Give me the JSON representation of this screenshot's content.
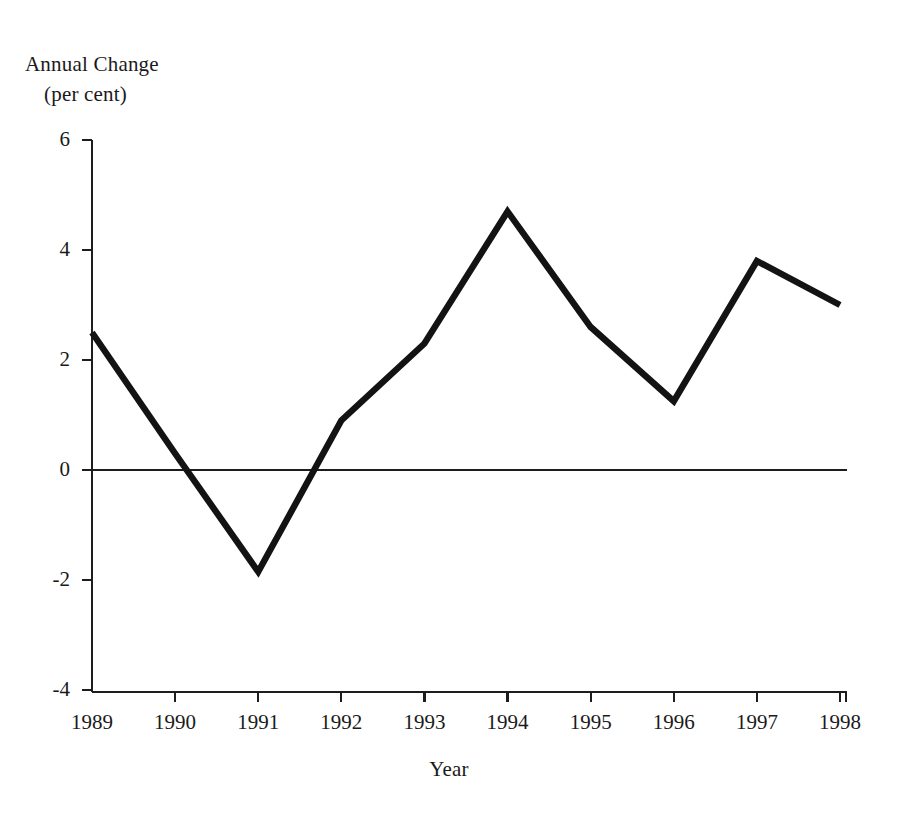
{
  "chart_data": {
    "type": "line",
    "title": "",
    "ylabel_lines": [
      "Annual Change",
      "(per cent)"
    ],
    "ylabel": "Annual Change (per cent)",
    "xlabel": "Year",
    "categories": [
      "1989",
      "1990",
      "1991",
      "1992",
      "1993",
      "1994",
      "1995",
      "1996",
      "1997",
      "1998"
    ],
    "x": [
      1989,
      1990,
      1991,
      1992,
      1993,
      1994,
      1995,
      1996,
      1997,
      1998
    ],
    "values": [
      2.5,
      0.3,
      -1.85,
      0.9,
      2.3,
      4.7,
      2.6,
      1.25,
      3.8,
      3.0
    ],
    "series": [
      {
        "name": "Annual Change",
        "values": [
          2.5,
          0.3,
          -1.85,
          0.9,
          2.3,
          4.7,
          2.6,
          1.25,
          3.8,
          3.0
        ],
        "color": "#131313"
      }
    ],
    "ylim": [
      -4,
      6
    ],
    "yticks": [
      6,
      4,
      2,
      0,
      -2,
      -4
    ],
    "ytick_labels": [
      "6",
      "4",
      "2",
      "0",
      "-2",
      "-4"
    ],
    "xlim": [
      1989,
      1998
    ],
    "xticks": [
      1989,
      1990,
      1991,
      1992,
      1993,
      1994,
      1995,
      1996,
      1997,
      1998
    ],
    "xtick_labels": [
      "1989",
      "1990",
      "1991",
      "1992",
      "1993",
      "1994",
      "1995",
      "1996",
      "1997",
      "1998"
    ],
    "grid": false,
    "legend": "none",
    "zero_line": 0,
    "line_color": "#131313",
    "axis_color": "#1d1d1d",
    "background": "#ffffff"
  }
}
